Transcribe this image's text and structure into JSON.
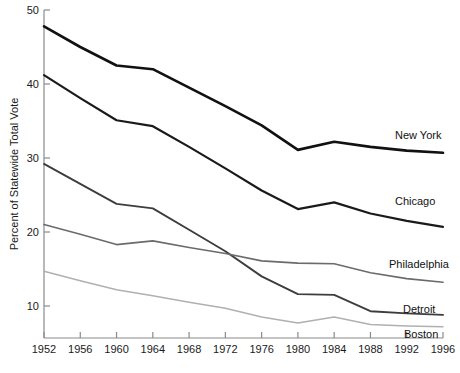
{
  "chart_data": {
    "type": "line",
    "title": "",
    "xlabel": "",
    "ylabel": "Percent of Statewide Total Vote",
    "x": [
      1952,
      1956,
      1960,
      1964,
      1968,
      1972,
      1976,
      1980,
      1984,
      1988,
      1992,
      1996
    ],
    "xtick_labels": [
      "1952",
      "1956",
      "1960",
      "1964",
      "1968",
      "1972",
      "1976",
      "1980",
      "1984",
      "1988",
      "1992",
      "1996"
    ],
    "ytick_labels": [
      "10",
      "20",
      "30",
      "40",
      "50"
    ],
    "ytick_values": [
      10,
      20,
      30,
      40,
      50
    ],
    "xlim": [
      1952,
      1996
    ],
    "ylim": [
      5.4,
      50
    ],
    "grid": false,
    "legend_position": "right-inline-end-of-line",
    "series": [
      {
        "name": "New York",
        "label": "New York",
        "color": "#111111",
        "width": 2.6,
        "values": [
          47.8,
          45.0,
          42.5,
          42.0,
          39.5,
          37.0,
          34.4,
          31.1,
          32.2,
          31.5,
          31.0,
          30.7
        ]
      },
      {
        "name": "Chicago",
        "label": "Chicago",
        "color": "#1a1a1a",
        "width": 2.2,
        "values": [
          41.2,
          38.1,
          35.1,
          34.3,
          31.5,
          28.6,
          25.6,
          23.1,
          24.0,
          22.5,
          21.5,
          20.7
        ]
      },
      {
        "name": "Detroit",
        "label": "Detroit",
        "color": "#3d3d3d",
        "width": 1.9,
        "values": [
          29.2,
          26.5,
          23.8,
          23.2,
          20.3,
          17.4,
          14.0,
          11.6,
          11.5,
          9.3,
          9.0,
          8.8
        ]
      },
      {
        "name": "Philadelphia",
        "label": "Philadelphia",
        "color": "#6b6b6b",
        "width": 1.6,
        "values": [
          21.0,
          19.7,
          18.3,
          18.8,
          17.9,
          17.1,
          16.1,
          15.8,
          15.7,
          14.5,
          13.7,
          13.2
        ]
      },
      {
        "name": "Boston",
        "label": "Boston",
        "color": "#b0b0b0",
        "width": 1.5,
        "values": [
          14.7,
          13.4,
          12.2,
          11.4,
          10.5,
          9.7,
          8.5,
          7.7,
          8.5,
          7.5,
          7.3,
          7.2
        ]
      }
    ],
    "label_positions": [
      {
        "name": "New York",
        "x": 395,
        "y": 139
      },
      {
        "name": "Chicago",
        "x": 395,
        "y": 205
      },
      {
        "name": "Philadelphia",
        "x": 389,
        "y": 268
      },
      {
        "name": "Detroit",
        "x": 403,
        "y": 313
      },
      {
        "name": "Boston",
        "x": 404,
        "y": 338
      }
    ]
  }
}
